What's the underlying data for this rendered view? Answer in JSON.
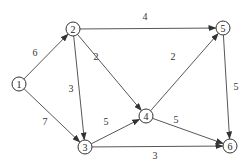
{
  "diagram": {
    "type": "directed-weighted-graph",
    "nodes": [
      {
        "id": "1",
        "label": "1",
        "x": 19,
        "y": 84
      },
      {
        "id": "2",
        "label": "2",
        "x": 73,
        "y": 29
      },
      {
        "id": "3",
        "label": "3",
        "x": 85,
        "y": 147
      },
      {
        "id": "4",
        "label": "4",
        "x": 146,
        "y": 116
      },
      {
        "id": "5",
        "label": "5",
        "x": 223,
        "y": 28
      },
      {
        "id": "6",
        "label": "6",
        "x": 230,
        "y": 146
      }
    ],
    "edges": [
      {
        "from": "1",
        "to": "2",
        "weight": "6",
        "lx": 35,
        "ly": 52
      },
      {
        "from": "1",
        "to": "3",
        "weight": "7",
        "lx": 45,
        "ly": 121
      },
      {
        "from": "2",
        "to": "5",
        "weight": "4",
        "lx": 145,
        "ly": 16
      },
      {
        "from": "2",
        "to": "3",
        "weight": "3",
        "lx": 71,
        "ly": 88
      },
      {
        "from": "2",
        "to": "4",
        "weight": "2",
        "lx": 96,
        "ly": 56
      },
      {
        "from": "3",
        "to": "4",
        "weight": "5",
        "lx": 106,
        "ly": 121
      },
      {
        "from": "4",
        "to": "5",
        "weight": "2",
        "lx": 173,
        "ly": 56
      },
      {
        "from": "5",
        "to": "6",
        "weight": "5",
        "lx": 236,
        "ly": 86
      },
      {
        "from": "4",
        "to": "6",
        "weight": "5",
        "lx": 176,
        "ly": 119
      },
      {
        "from": "3",
        "to": "6",
        "weight": "3",
        "lx": 155,
        "ly": 155
      }
    ]
  }
}
